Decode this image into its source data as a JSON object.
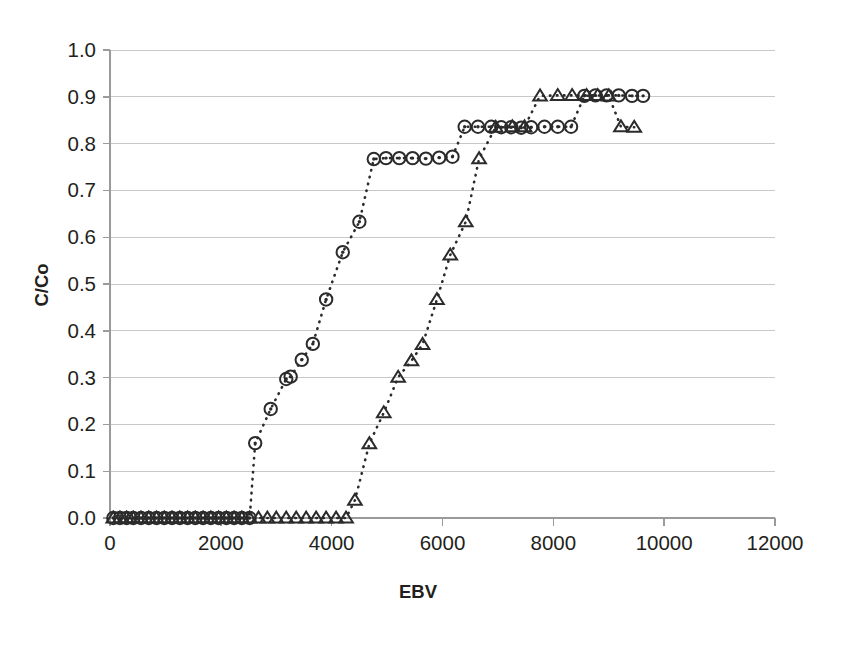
{
  "chart_data": {
    "type": "scatter",
    "title": "",
    "subtitle": "",
    "xlabel": "EBV",
    "ylabel": "C/Co",
    "xlim": [
      0,
      12000
    ],
    "ylim": [
      0.0,
      1.0
    ],
    "xticks": [
      0,
      2000,
      4000,
      6000,
      8000,
      10000,
      12000
    ],
    "xtick_labels": [
      "0",
      "2000",
      "4000",
      "6000",
      "8000",
      "10000",
      "12000"
    ],
    "yticks": [
      0.0,
      0.1,
      0.2,
      0.3,
      0.4,
      0.5,
      0.6,
      0.7,
      0.8,
      0.9,
      1.0
    ],
    "ytick_labels": [
      "0.0",
      "0.1",
      "0.2",
      "0.3",
      "0.4",
      "0.5",
      "0.6",
      "0.7",
      "0.8",
      "0.9",
      "1.0"
    ],
    "grid": "horizontal",
    "legend": "none",
    "marker_style": [
      "circle-dot",
      "triangle-up"
    ],
    "line_style": "dotted",
    "series": [
      {
        "name": "series-circle",
        "marker": "circle-dot",
        "x": [
          60,
          180,
          300,
          420,
          560,
          700,
          840,
          980,
          1120,
          1260,
          1400,
          1540,
          1680,
          1820,
          1960,
          2100,
          2240,
          2380,
          2520,
          2620,
          2900,
          3180,
          3260,
          3460,
          3660,
          3900,
          4200,
          4500,
          4760,
          4980,
          5220,
          5460,
          5700,
          5940,
          6180,
          6400,
          6640,
          6880,
          7060,
          7240,
          7420,
          7600,
          7840,
          8080,
          8320,
          8560,
          8760,
          8960,
          9180,
          9420,
          9620
        ],
        "y": [
          0.0,
          0.0,
          0.0,
          0.0,
          0.0,
          0.0,
          0.0,
          0.0,
          0.0,
          0.0,
          0.0,
          0.0,
          0.0,
          0.0,
          0.0,
          0.0,
          0.0,
          0.0,
          0.0,
          0.16,
          0.233,
          0.297,
          0.302,
          0.338,
          0.372,
          0.467,
          0.568,
          0.633,
          0.767,
          0.769,
          0.769,
          0.769,
          0.768,
          0.77,
          0.772,
          0.836,
          0.836,
          0.836,
          0.835,
          0.835,
          0.834,
          0.835,
          0.836,
          0.836,
          0.836,
          0.902,
          0.903,
          0.903,
          0.903,
          0.902,
          0.902
        ]
      },
      {
        "name": "series-triangle",
        "marker": "triangle-up",
        "x": [
          60,
          180,
          300,
          420,
          560,
          700,
          840,
          980,
          1120,
          1260,
          1400,
          1540,
          1680,
          1820,
          1960,
          2100,
          2240,
          2380,
          2520,
          2680,
          2840,
          3000,
          3180,
          3360,
          3540,
          3720,
          3900,
          4080,
          4260,
          4420,
          4680,
          4940,
          5200,
          5440,
          5640,
          5900,
          6140,
          6420,
          6660,
          6960,
          7260,
          7480,
          7760,
          8080,
          8340,
          8600,
          8800,
          9000,
          9220,
          9460
        ],
        "y": [
          0.0,
          0.0,
          0.0,
          0.0,
          0.0,
          0.0,
          0.0,
          0.0,
          0.0,
          0.0,
          0.0,
          0.0,
          0.0,
          0.0,
          0.0,
          0.0,
          0.0,
          0.0,
          0.0,
          0.0,
          0.0,
          0.0,
          0.0,
          0.0,
          0.0,
          0.0,
          0.0,
          0.0,
          0.0,
          0.038,
          0.159,
          0.225,
          0.301,
          0.336,
          0.371,
          0.467,
          0.562,
          0.633,
          0.768,
          0.835,
          0.836,
          0.836,
          0.902,
          0.903,
          0.903,
          0.903,
          0.903,
          0.902,
          0.836,
          0.835
        ]
      }
    ]
  },
  "axes": {
    "plot_area": {
      "left": 110,
      "right": 775,
      "top": 50,
      "bottom": 518
    },
    "colors": {
      "grid": "#c8c8c8",
      "axis": "#9a9a9a",
      "marker": "#2b2b2b",
      "background": "#ffffff",
      "text": "#231f20"
    }
  }
}
